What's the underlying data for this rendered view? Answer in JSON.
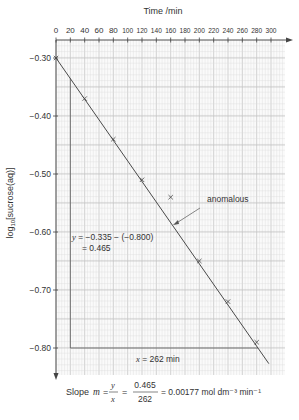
{
  "chart_data": {
    "type": "scatter",
    "title": "",
    "xlabel": "Time /min",
    "ylabel": "log10[sucrose(aq)]",
    "xlim": [
      0,
      300
    ],
    "ylim": [
      -0.85,
      -0.3
    ],
    "x_ticks": [
      0,
      20,
      40,
      60,
      80,
      100,
      120,
      140,
      160,
      180,
      200,
      220,
      240,
      260,
      280,
      300
    ],
    "y_ticks": [
      -0.3,
      -0.4,
      -0.5,
      -0.6,
      -0.7,
      -0.8
    ],
    "y_tick_labels": [
      "−0.30",
      "−0.40",
      "−0.50",
      "−0.60",
      "−0.70",
      "−0.80"
    ],
    "x_axis_position": "top",
    "grid": true,
    "series": [
      {
        "name": "data points",
        "marker": "x",
        "x": [
          0,
          40,
          80,
          120,
          200,
          240,
          280
        ],
        "y": [
          -0.3,
          -0.37,
          -0.44,
          -0.51,
          -0.65,
          -0.72,
          -0.79
        ]
      },
      {
        "name": "anomalous",
        "marker": "x",
        "x": [
          160
        ],
        "y": [
          -0.54
        ]
      }
    ],
    "best_fit_line": {
      "x": [
        0,
        297
      ],
      "y": [
        -0.3,
        -0.827
      ]
    },
    "gradient_triangle": {
      "vertical": {
        "x": 20,
        "y_from": -0.335,
        "y_to": -0.8
      },
      "horizontal": {
        "y": -0.8,
        "x_from": 20,
        "x_to": 282
      }
    },
    "annotations": {
      "anomalous_label": "anomalous",
      "y_calc_line1": "y = −0.335 − (−0.800)",
      "y_calc_line2": "= 0.465",
      "x_calc": "x = 262 min",
      "slope_prefix": "Slope",
      "slope_m": "m",
      "slope_eq": "=",
      "slope_frac_num": "y",
      "slope_frac_den": "x",
      "slope_val_num": "0.465",
      "slope_val_den": "262",
      "slope_result": "= 0.00177 mol dm⁻³ min⁻¹"
    },
    "colors": {
      "grid_minor": "#dcdcdc",
      "grid_major": "#b8b8b8",
      "line": "#4a4a4a",
      "text": "#333333"
    }
  }
}
